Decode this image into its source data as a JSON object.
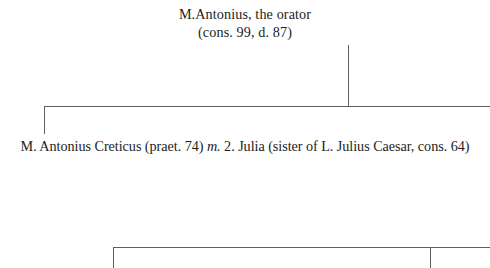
{
  "figure": {
    "kind": "genealogical-stemma",
    "background_color": "#ffffff",
    "text_color": "#1d1d1d",
    "rule_color": "#5d5f61"
  },
  "nodes": {
    "root": {
      "name_line": "M.Antonius, the orator",
      "detail_line": "(cons. 99, d. 87)"
    },
    "generation2": {
      "person": "M. Antonius Creticus (praet. 74)",
      "marriage_mark": "m.",
      "spouse": "2. Julia (sister of L. Julius Caesar, cons. 64)",
      "full_text": "M. Antonius Creticus (praet. 74) m. 2. Julia (sister of L. Julius Caesar, cons. 64)"
    }
  },
  "connectors": [
    {
      "id": "stem-root",
      "orientation": "vertical"
    },
    {
      "id": "bar-gen2",
      "orientation": "horizontal"
    },
    {
      "id": "drop-gen2-left",
      "orientation": "vertical"
    },
    {
      "id": "bar-gen3",
      "orientation": "horizontal"
    },
    {
      "id": "drop-gen3-left",
      "orientation": "vertical"
    },
    {
      "id": "drop-gen3-right",
      "orientation": "vertical"
    }
  ]
}
